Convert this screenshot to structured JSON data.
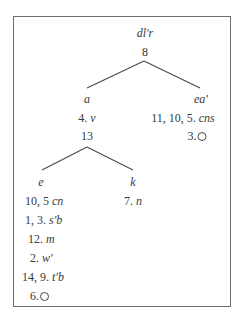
{
  "diagram": {
    "root": {
      "label": "dl'r",
      "number": "8"
    },
    "nodes": {
      "a": {
        "label": "a",
        "annotation_num": "4.",
        "annotation_sym": "v",
        "number": "13"
      },
      "ea": {
        "label": "ea'",
        "annotation_num": "11, 10, 5.",
        "annotation_sym": "cns",
        "empty_num": "3.",
        "empty_icon": "circle-empty-icon"
      },
      "e": {
        "label": "e",
        "entries": [
          {
            "num": "10, 5",
            "sym": "cn"
          },
          {
            "num": "1, 3.",
            "sym": "s'b"
          },
          {
            "num": "12.",
            "sym": "m"
          },
          {
            "num": "2.",
            "sym": "w'"
          },
          {
            "num": "14, 9.",
            "sym": "t'b"
          }
        ],
        "empty_num": "6.",
        "empty_icon": "circle-empty-icon"
      },
      "k": {
        "label": "k",
        "annotation_num": "7.",
        "annotation_sym": "n"
      }
    },
    "edges": [
      {
        "from": "root",
        "to": "a"
      },
      {
        "from": "root",
        "to": "ea"
      },
      {
        "from": "a",
        "to": "e"
      },
      {
        "from": "a",
        "to": "k"
      }
    ]
  }
}
